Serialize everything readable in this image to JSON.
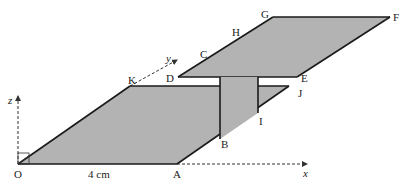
{
  "diagram": {
    "type": "3d-geometry-figure",
    "colors": {
      "fill": "#b3b3b3",
      "stroke": "#1a1a1a",
      "axis": "#333333",
      "background": "#ffffff"
    },
    "axes": {
      "x_label": "x",
      "y_label": "y",
      "z_label": "z"
    },
    "points": {
      "O": "O",
      "A": "A",
      "B": "B",
      "C": "C",
      "D": "D",
      "E": "E",
      "F": "F",
      "G": "G",
      "H": "H",
      "I": "I",
      "J": "J",
      "K": "K"
    },
    "dimension_label": "4 cm"
  }
}
